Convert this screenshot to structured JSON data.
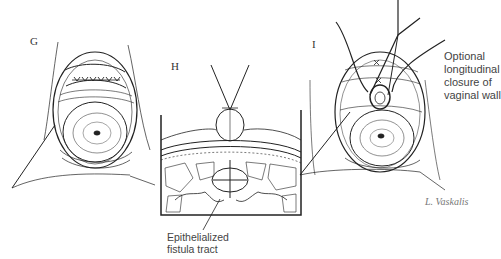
{
  "figure": {
    "panels": [
      {
        "id": "G",
        "label": "G"
      },
      {
        "id": "H",
        "label": "H",
        "annotation": [
          "Epithelialized",
          "fistula tract"
        ]
      },
      {
        "id": "I",
        "label": "I",
        "annotation": [
          "Optional",
          "longitudinal",
          "closure of",
          "vaginal wall"
        ]
      }
    ],
    "signature": "L. Vaskalis",
    "colors": {
      "ink": "#222222",
      "hatch": "#555555",
      "background": "#ffffff"
    }
  }
}
